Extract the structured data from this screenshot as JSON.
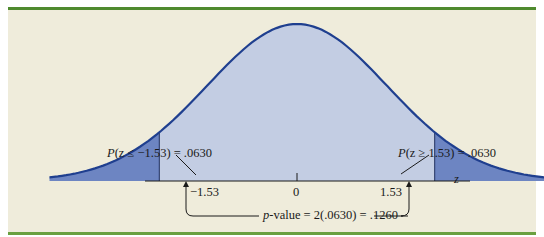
{
  "figure": {
    "left_annotation": {
      "prefix": "P",
      "var": "z",
      "text": "(z ≤ −1.53) = .0630"
    },
    "right_annotation": {
      "prefix": "P",
      "var": "z",
      "text": "(z ≥ 1.53) = .0630"
    },
    "tick_labels": {
      "left": "−1.53",
      "center": "0",
      "right": "1.53"
    },
    "axis_label": "z",
    "pvalue": {
      "var": "p",
      "text": "-value = 2(.0630) = .1260"
    }
  },
  "colors": {
    "background": "#efecdb",
    "frame_bar": "#4f8a2e",
    "curve_stroke": "#1f3f8f",
    "fill_body": "#c3cde3",
    "fill_tail": "#6d85c2",
    "axis": "#1a1a1a"
  },
  "chart_data": {
    "type": "area",
    "title": "",
    "distribution": "standard normal",
    "xlabel": "z",
    "ylabel": "",
    "x_ticks": [
      -1.53,
      0,
      1.53
    ],
    "tick_labels": [
      "−1.53",
      "0",
      "1.53"
    ],
    "shaded_regions": [
      {
        "range": [
          -4,
          -1.53
        ],
        "probability": 0.063,
        "label": "P(z ≤ −1.53) = .0630"
      },
      {
        "range": [
          1.53,
          4
        ],
        "probability": 0.063,
        "label": "P(z ≥ 1.53) = .0630"
      }
    ],
    "annotations": [
      "p-value = 2(.0630) = .1260"
    ],
    "grid": false,
    "legend": null
  }
}
